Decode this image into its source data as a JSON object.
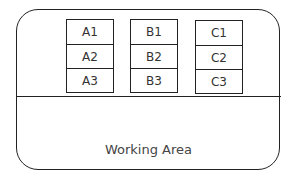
{
  "diagram": {
    "columns": [
      {
        "id": "A",
        "cells": [
          "A1",
          "A2",
          "A3"
        ]
      },
      {
        "id": "B",
        "cells": [
          "B1",
          "B2",
          "B3"
        ]
      },
      {
        "id": "C",
        "cells": [
          "C1",
          "C2",
          "C3"
        ]
      }
    ],
    "working_area_label": "Working Area"
  }
}
